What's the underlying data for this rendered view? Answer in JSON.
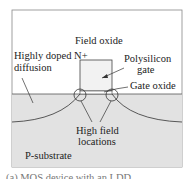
{
  "diagram": {
    "labels": {
      "field_oxide": "Field oxide",
      "n_plus_line1": "Highly doped N+",
      "n_plus_line2": "diffusion",
      "poly_line1": "Polysilicon",
      "poly_line2": "gate",
      "gate_oxide": "Gate oxide",
      "high_field_line1": "High field",
      "high_field_line2": "locations",
      "substrate": "P-substrate"
    },
    "caption_partial": "(a) MOS device with an LDD..."
  },
  "colors": {
    "substrate": "#e2e2e2",
    "oxide": "#ffffff",
    "gate": "#f2f2f2",
    "line": "#444444"
  }
}
